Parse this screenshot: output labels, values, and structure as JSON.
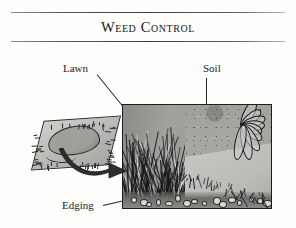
{
  "page": {
    "title": "Weed Control",
    "background_color": "#fdfdfc",
    "ink_color": "#1c1c20"
  },
  "header": {
    "title": "Weed Control",
    "rule_top": true,
    "rule_bottom": true
  },
  "figure": {
    "type": "engraved-illustration",
    "callouts": [
      {
        "id": "lawn",
        "label": "Lawn",
        "leader": "diagonal-down-right"
      },
      {
        "id": "soil",
        "label": "Soil",
        "leader": "vertical-down"
      },
      {
        "id": "edging",
        "label": "Edging",
        "leader": "diagonal-up-right"
      }
    ],
    "photo": {
      "name": "lawn-edging-photo",
      "regions": [
        "grass-clump",
        "edging-strip",
        "soil-bed",
        "paved-area",
        "plant"
      ]
    },
    "inset": {
      "name": "sod-piece-diagram",
      "parts": [
        "turf-slab",
        "weed-patch",
        "transfer-arrow"
      ]
    }
  },
  "colors": {
    "rule": "#3c3c41",
    "photo_border": "#1d1d20",
    "soil": "#9d9c98",
    "edging_strip": "#d2d1cd",
    "grass": "#8b8a86",
    "turf": "#cfcecb",
    "arrow": "#2a2a2e"
  }
}
